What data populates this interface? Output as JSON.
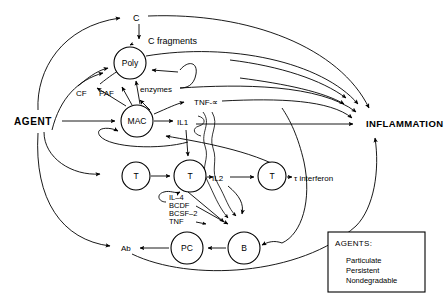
{
  "figure": {
    "type": "flow-diagram",
    "title_visible": false,
    "background_color": "#ffffff",
    "line_color": "#000000",
    "width": 445,
    "height": 303
  },
  "inputs": {
    "agent_label": "AGENT"
  },
  "outputs": {
    "inflammation_label": "INFLAMMATION"
  },
  "nodes": [
    {
      "id": "poly",
      "label": "Poly",
      "shape": "circle",
      "cx": 130,
      "cy": 63,
      "r": 16
    },
    {
      "id": "mac",
      "label": "MAC",
      "shape": "circle",
      "cx": 137,
      "cy": 121,
      "r": 16
    },
    {
      "id": "t1",
      "label": "T",
      "shape": "circle",
      "cx": 136,
      "cy": 176,
      "r": 14
    },
    {
      "id": "t2",
      "label": "T",
      "shape": "circle",
      "cx": 190,
      "cy": 176,
      "r": 16
    },
    {
      "id": "t3",
      "label": "T",
      "shape": "circle",
      "cx": 272,
      "cy": 176,
      "r": 14
    },
    {
      "id": "pc",
      "label": "PC",
      "shape": "circle",
      "cx": 187,
      "cy": 248,
      "r": 16
    },
    {
      "id": "b",
      "label": "B",
      "shape": "circle",
      "cx": 244,
      "cy": 248,
      "r": 16
    }
  ],
  "mediators": [
    {
      "id": "c",
      "label": "C",
      "x": 138,
      "y": 18
    },
    {
      "id": "c_fragments",
      "label": "C fragments",
      "x": 155,
      "y": 40
    },
    {
      "id": "cf",
      "label": "CF",
      "x": 84,
      "y": 93
    },
    {
      "id": "paf",
      "label": "PAF",
      "x": 108,
      "y": 93
    },
    {
      "id": "enzymes",
      "label": "enzymes",
      "x": 144,
      "y": 90
    },
    {
      "id": "tnf_alpha",
      "label": "TNF-∝",
      "x": 201,
      "y": 102
    },
    {
      "id": "il1",
      "label": "IL1",
      "x": 183,
      "y": 122
    },
    {
      "id": "il2",
      "label": "IL2",
      "x": 219,
      "y": 178
    },
    {
      "id": "interferon",
      "label": "τ interferon",
      "x": 298,
      "y": 178
    },
    {
      "id": "ab",
      "label": "Ab",
      "x": 127,
      "y": 248
    }
  ],
  "cytokine_list": [
    {
      "id": "il4",
      "label": "IL–4"
    },
    {
      "id": "bcdf",
      "label": "BCDF"
    },
    {
      "id": "bcsf2",
      "label": "BCSF–2"
    },
    {
      "id": "tnf",
      "label": "TNF"
    }
  ],
  "legend": {
    "title": "AGENTS:",
    "items": [
      "Particulate",
      "Persistent",
      "Nondegradable"
    ],
    "box": {
      "x": 328,
      "y": 232,
      "width": 97,
      "height": 60
    }
  },
  "edges": [
    {
      "from": "agent",
      "to": "c"
    },
    {
      "from": "agent",
      "to": "mac"
    },
    {
      "from": "agent",
      "to": "poly"
    },
    {
      "from": "agent",
      "to": "t1"
    },
    {
      "from": "agent",
      "to": "ab"
    },
    {
      "from": "c",
      "to": "c_fragments"
    },
    {
      "from": "c",
      "to": "inflammation"
    },
    {
      "from": "c_fragments",
      "to": "poly"
    },
    {
      "from": "poly",
      "to": "inflammation"
    },
    {
      "from": "poly",
      "to": "enzymes"
    },
    {
      "from": "mac",
      "to": "cf"
    },
    {
      "from": "mac",
      "to": "paf"
    },
    {
      "from": "mac",
      "to": "il1"
    },
    {
      "from": "mac",
      "to": "tnf_alpha"
    },
    {
      "from": "mac",
      "to": "poly"
    },
    {
      "from": "tnf_alpha",
      "to": "inflammation"
    },
    {
      "from": "il1",
      "to": "inflammation"
    },
    {
      "from": "il1",
      "to": "t2"
    },
    {
      "from": "t1",
      "to": "t2"
    },
    {
      "from": "t2",
      "to": "il2"
    },
    {
      "from": "il2",
      "to": "t3"
    },
    {
      "from": "il2",
      "to": "b"
    },
    {
      "from": "t3",
      "to": "interferon"
    },
    {
      "from": "interferon",
      "to": "mac"
    },
    {
      "from": "t2",
      "to": "b"
    },
    {
      "from": "b",
      "to": "pc"
    },
    {
      "from": "pc",
      "to": "ab"
    },
    {
      "from": "b",
      "to": "inflammation"
    },
    {
      "from": "ab",
      "to": "inflammation"
    }
  ]
}
